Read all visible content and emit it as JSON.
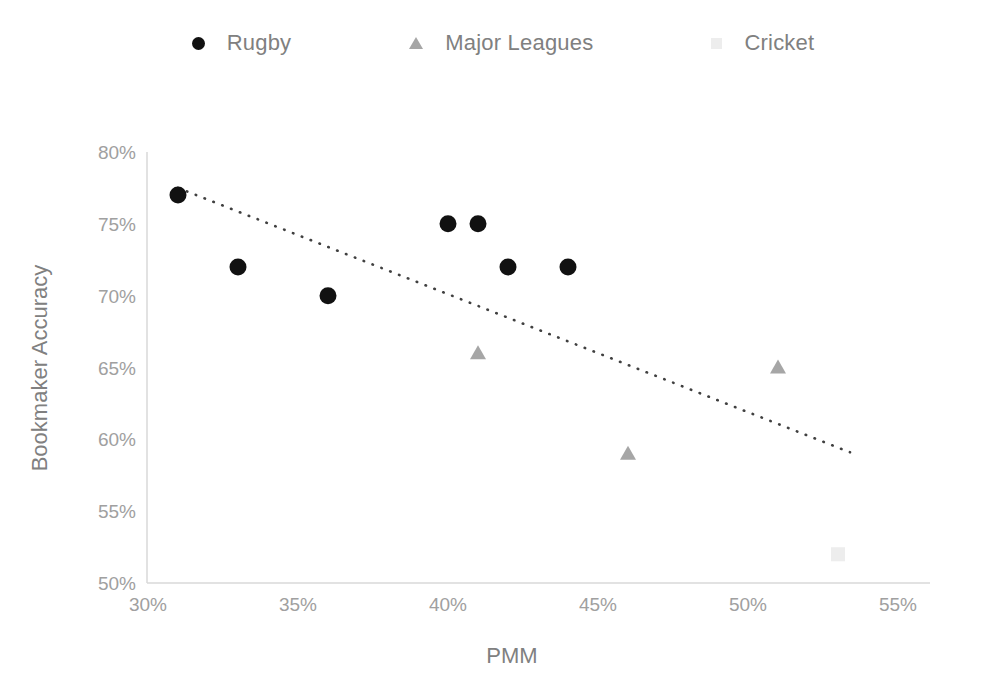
{
  "chart_data": {
    "type": "scatter",
    "title": "",
    "xlabel": "PMM",
    "ylabel": "Bookmaker Accuracy",
    "xlim": [
      30,
      55
    ],
    "ylim": [
      50,
      80
    ],
    "xticks": [
      "30%",
      "35%",
      "40%",
      "45%",
      "50%",
      "55%"
    ],
    "xtick_values": [
      30,
      35,
      40,
      45,
      50,
      55
    ],
    "yticks": [
      "50%",
      "55%",
      "60%",
      "65%",
      "70%",
      "75%",
      "80%"
    ],
    "ytick_values": [
      50,
      55,
      60,
      65,
      70,
      75,
      80
    ],
    "grid": false,
    "legend_position": "top-center",
    "series": [
      {
        "name": "Rugby",
        "marker": "circle",
        "color": "#111111",
        "points": [
          {
            "x": 31,
            "y": 77
          },
          {
            "x": 33,
            "y": 72
          },
          {
            "x": 36,
            "y": 70
          },
          {
            "x": 40,
            "y": 75
          },
          {
            "x": 41,
            "y": 75
          },
          {
            "x": 42,
            "y": 72
          },
          {
            "x": 44,
            "y": 72
          }
        ]
      },
      {
        "name": "Major Leagues",
        "marker": "triangle",
        "color": "#a6a6a6",
        "points": [
          {
            "x": 41,
            "y": 66
          },
          {
            "x": 46,
            "y": 59
          },
          {
            "x": 51,
            "y": 65
          }
        ]
      },
      {
        "name": "Cricket",
        "marker": "square",
        "color": "#ededed",
        "points": [
          {
            "x": 53,
            "y": 52
          }
        ]
      }
    ],
    "trendline": {
      "style": "dotted",
      "color": "#404040",
      "x_start": 31,
      "y_start": 77.5,
      "x_end": 53.4,
      "y_end": 59.1
    }
  },
  "legend": {
    "entries": [
      {
        "label": "Rugby",
        "marker": "circle-marker"
      },
      {
        "label": "Major Leagues",
        "marker": "triangle-marker"
      },
      {
        "label": "Cricket",
        "marker": "square-marker"
      }
    ]
  },
  "axes": {
    "x_title": "PMM",
    "y_title": "Bookmaker Accuracy",
    "x_labels": [
      "30%",
      "35%",
      "40%",
      "45%",
      "50%",
      "55%"
    ],
    "y_labels": [
      "80%",
      "75%",
      "70%",
      "65%",
      "60%",
      "55%",
      "50%"
    ]
  }
}
